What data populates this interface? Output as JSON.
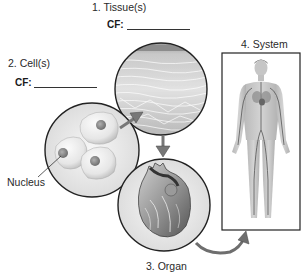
{
  "diagram": {
    "levels": [
      {
        "number": 1,
        "label": "1. Tissue(s)",
        "cf_label": "CF:",
        "cf_value": ""
      },
      {
        "number": 2,
        "label": "2. Cell(s)",
        "cf_label": "CF:",
        "cf_value": ""
      },
      {
        "number": 3,
        "label": "3. Organ"
      },
      {
        "number": 4,
        "label": "4. System"
      }
    ],
    "annotations": {
      "nucleus": "Nucleus"
    },
    "images": {
      "cells": "cells-illustration",
      "tissue": "tissue-illustration",
      "organ": "heart-illustration",
      "system": "circulatory-system-illustration"
    },
    "colors": {
      "outline": "#222222",
      "arrow": "#6e6e6e",
      "background": "#ffffff"
    }
  }
}
